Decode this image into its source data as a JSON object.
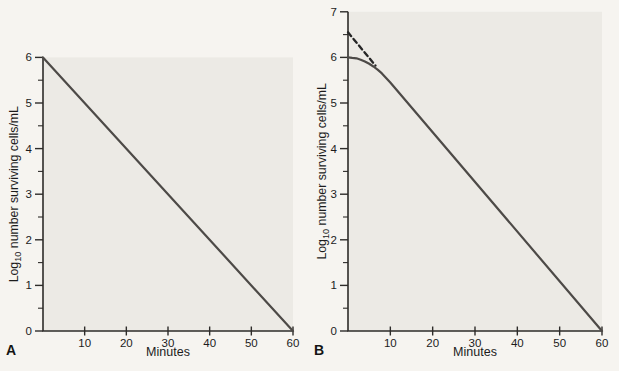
{
  "page": {
    "background": "#f6f4f0",
    "plot_fill": "#eceae5",
    "axis_color": "#2e2c2a",
    "text_color": "#1c1c1c"
  },
  "chart_data": [
    {
      "type": "line",
      "panel_label": "A",
      "xlabel": "Minutes",
      "ylabel": "Log10 number surviving cells/mL",
      "ylabel_parts": {
        "prefix": "Log",
        "sub": "10",
        "rest": " number surviving cells/mL"
      },
      "xlim": [
        0,
        60
      ],
      "ylim": [
        0,
        6
      ],
      "xticks": [
        10,
        20,
        30,
        40,
        50,
        60
      ],
      "yticks": [
        0,
        1,
        2,
        3,
        4,
        5,
        6
      ],
      "y_minor_tick_step": 0.5,
      "grid": false,
      "legend": "none",
      "series": [
        {
          "name": "linear-survivor-line",
          "style": "solid",
          "color": "#4d4a47",
          "points": [
            [
              0,
              6
            ],
            [
              60,
              0
            ]
          ]
        }
      ]
    },
    {
      "type": "line",
      "panel_label": "B",
      "xlabel": "Minutes",
      "ylabel": "Log10 number surviving cells/mL",
      "ylabel_parts": {
        "prefix": "Log",
        "sub": "10",
        "rest": " number surviving cells/mL"
      },
      "xlim": [
        0,
        60
      ],
      "ylim": [
        0,
        7
      ],
      "xticks": [
        10,
        20,
        30,
        40,
        50,
        60
      ],
      "yticks": [
        0,
        1,
        2,
        3,
        4,
        5,
        6,
        7
      ],
      "y_minor_tick_step": 0.5,
      "grid": false,
      "legend": "none",
      "series": [
        {
          "name": "shoulder-survivor-curve",
          "style": "solid",
          "color": "#4d4a47",
          "points": [
            [
              0,
              6.0
            ],
            [
              1,
              5.99
            ],
            [
              2,
              5.98
            ],
            [
              3,
              5.95
            ],
            [
              4,
              5.91
            ],
            [
              5,
              5.86
            ],
            [
              6,
              5.8
            ],
            [
              7,
              5.73
            ],
            [
              8,
              5.65
            ],
            [
              9,
              5.55
            ],
            [
              10,
              5.45
            ],
            [
              60,
              0
            ]
          ]
        },
        {
          "name": "extrapolated-dashed-line",
          "style": "dashed",
          "color": "#262626",
          "points": [
            [
              0,
              6.55
            ],
            [
              6.5,
              5.82
            ]
          ]
        }
      ]
    }
  ]
}
